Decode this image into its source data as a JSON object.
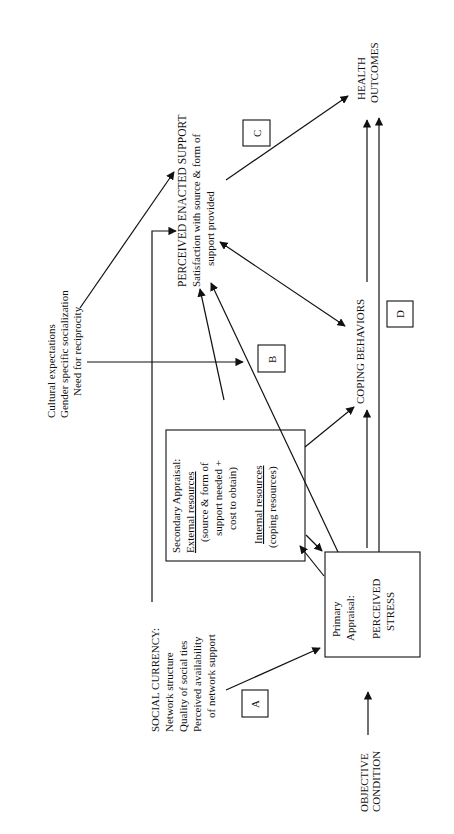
{
  "diagram": {
    "orientation": "rotated -90deg (text reads bottom to top)",
    "nodes": {
      "objective_condition": [
        "OBJECTIVE",
        "CONDITION"
      ],
      "social_currency": {
        "title": "SOCIAL CURRENCY:",
        "items": [
          "Network structure",
          "Quality of social ties",
          "Perceived availability",
          "of network support"
        ]
      },
      "cultural": [
        "Cultural expectations",
        "Gender specific socialization",
        "Need for reciprocity"
      ],
      "primary_appraisal": {
        "line1": "Primary",
        "line2": "Appraisal:",
        "line3": "PERCEIVED",
        "line4": "STRESS"
      },
      "secondary_appraisal": {
        "title": "Secondary Appraisal:",
        "external": "External resources",
        "external_detail": [
          "(source & form of",
          "support  needed +",
          "cost to obtain)"
        ],
        "internal": "Internal resources",
        "internal_detail": "(coping resources)"
      },
      "perceived_enacted_support": {
        "title": "PERCEIVED ENACTED SUPPORT",
        "detail": [
          "Satisfaction with source & form of",
          "support provided"
        ]
      },
      "coping_behaviors": "COPING BEHAVIORS",
      "health_outcomes": [
        "HEALTH",
        "OUTCOMES"
      ]
    },
    "path_labels": {
      "a": "A",
      "b": "B",
      "c": "C",
      "d": "D"
    }
  }
}
